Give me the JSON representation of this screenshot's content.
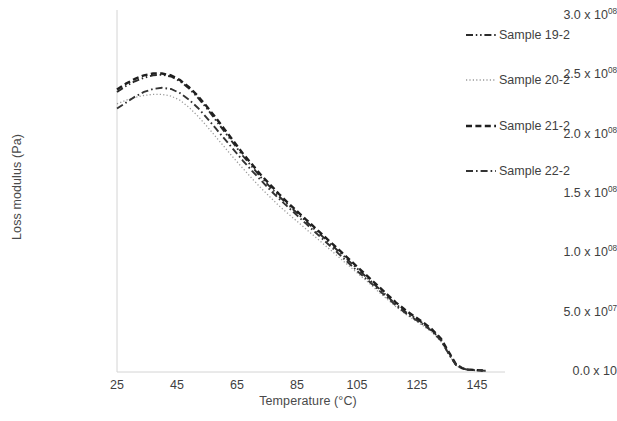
{
  "chart_data": {
    "type": "line",
    "title": "",
    "xlabel": "Temperature (°C)",
    "ylabel": "Loss modulus (Pa)",
    "xlim": [
      25,
      149
    ],
    "ylim": [
      0,
      300000000
    ],
    "xticks": [
      25,
      45,
      65,
      85,
      105,
      125,
      145
    ],
    "xtick_labels": [
      "25",
      "45",
      "65",
      "85",
      "105",
      "125",
      "145"
    ],
    "yticks": [
      0,
      50000000,
      100000000,
      150000000,
      200000000,
      250000000,
      300000000
    ],
    "ytick_labels": [
      {
        "mantissa": "0.0 x 10",
        "exponent": ""
      },
      {
        "mantissa": "5.0 x 10",
        "exponent": "07"
      },
      {
        "mantissa": "1.0 x 10",
        "exponent": "08"
      },
      {
        "mantissa": "1.5 x 10",
        "exponent": "08"
      },
      {
        "mantissa": "2.0 x 10",
        "exponent": "08"
      },
      {
        "mantissa": "2.5 x 10",
        "exponent": "08"
      },
      {
        "mantissa": "3.0 x 10",
        "exponent": "08"
      }
    ],
    "grid": false,
    "legend_position": "right",
    "series": [
      {
        "name": "Sample 19-2",
        "style": "dash-dot-dot",
        "color": "#2b2b2b",
        "width": 1.9,
        "x": [
          25,
          28,
          31,
          34,
          37,
          40,
          43,
          46,
          49,
          52,
          55,
          58,
          61,
          64,
          67,
          70,
          73,
          76,
          79,
          82,
          85,
          88,
          91,
          94,
          97,
          100,
          103,
          106,
          109,
          112,
          115,
          118,
          121,
          124,
          127,
          130,
          133,
          136,
          138,
          140,
          142,
          145,
          148
        ],
        "y": [
          236000000,
          241000000,
          245000000,
          248000000,
          250000000,
          250500000,
          249000000,
          245000000,
          239000000,
          231000000,
          222000000,
          212000000,
          202000000,
          192000000,
          182000000,
          173000000,
          164000000,
          156000000,
          148000000,
          141000000,
          134000000,
          127000000,
          120000000,
          113000000,
          106000000,
          99000000,
          92000000,
          85000000,
          78000000,
          71000000,
          64000000,
          57000000,
          51000000,
          46000000,
          41000000,
          35000000,
          27000000,
          14000000,
          6000000,
          3000000,
          2000000,
          1500000,
          1000000
        ]
      },
      {
        "name": "Sample 20-2",
        "style": "dotted",
        "color": "#9a9a9a",
        "width": 1.3,
        "x": [
          25,
          28,
          31,
          34,
          37,
          40,
          43,
          46,
          49,
          52,
          55,
          58,
          61,
          64,
          67,
          70,
          73,
          76,
          79,
          82,
          85,
          88,
          91,
          94,
          97,
          100,
          103,
          106,
          109,
          112,
          115,
          118,
          121,
          124,
          127,
          130,
          133,
          136,
          138,
          140,
          142,
          145,
          148
        ],
        "y": [
          226000000,
          229000000,
          231500000,
          233000000,
          234000000,
          234000000,
          232500000,
          229000000,
          223000000,
          215500000,
          207000000,
          198000000,
          189000000,
          180000000,
          171500000,
          163000000,
          155000000,
          147500000,
          140000000,
          133500000,
          127000000,
          120500000,
          114000000,
          107500000,
          101000000,
          94500000,
          88000000,
          81500000,
          75000000,
          68000000,
          61500000,
          55000000,
          49000000,
          44000000,
          39000000,
          33500000,
          25500000,
          13000000,
          5500000,
          2800000,
          1800000,
          1300000,
          900000
        ]
      },
      {
        "name": "Sample 21-2",
        "style": "dashed",
        "color": "#1f1f1f",
        "width": 2.4,
        "x": [
          25,
          28,
          31,
          34,
          37,
          40,
          43,
          46,
          49,
          52,
          55,
          58,
          61,
          64,
          67,
          70,
          73,
          76,
          79,
          82,
          85,
          88,
          91,
          94,
          97,
          100,
          103,
          106,
          109,
          112,
          115,
          118,
          121,
          124,
          127,
          130,
          133,
          136,
          138,
          140,
          142,
          145,
          148
        ],
        "y": [
          238000000,
          243000000,
          247000000,
          250000000,
          251500000,
          251500000,
          250000000,
          246000000,
          240000000,
          232500000,
          223500000,
          214000000,
          204000000,
          194000000,
          184000000,
          175000000,
          166000000,
          158000000,
          150000000,
          142500000,
          135500000,
          128500000,
          121500000,
          114500000,
          107500000,
          100500000,
          93500000,
          86500000,
          79500000,
          72500000,
          65500000,
          58500000,
          52500000,
          47000000,
          42000000,
          36000000,
          28000000,
          15000000,
          6500000,
          3300000,
          2200000,
          1600000,
          1100000
        ]
      },
      {
        "name": "Sample 22-2",
        "style": "dash-dot",
        "color": "#333333",
        "width": 1.9,
        "x": [
          25,
          28,
          31,
          34,
          37,
          40,
          43,
          46,
          49,
          52,
          55,
          58,
          61,
          64,
          67,
          70,
          73,
          76,
          79,
          82,
          85,
          88,
          91,
          94,
          97,
          100,
          103,
          106,
          109,
          112,
          115,
          118,
          121,
          124,
          127,
          130,
          133,
          136,
          138,
          140,
          142,
          145,
          148
        ],
        "y": [
          222000000,
          227000000,
          232000000,
          236000000,
          238500000,
          239500000,
          238500000,
          235000000,
          229500000,
          222500000,
          214000000,
          205000000,
          196000000,
          187000000,
          178000000,
          169500000,
          161500000,
          153500000,
          146000000,
          139000000,
          132000000,
          125000000,
          118000000,
          111000000,
          104000000,
          97000000,
          90000000,
          83000000,
          76500000,
          69500000,
          63000000,
          56000000,
          50000000,
          45000000,
          40000000,
          34500000,
          26500000,
          13500000,
          5800000,
          3000000,
          1900000,
          1400000,
          950000
        ]
      }
    ]
  },
  "legend": {
    "items": [
      {
        "label": "Sample 19-2",
        "style": "dash-dot-dot"
      },
      {
        "label": "Sample 20-2",
        "style": "dotted"
      },
      {
        "label": "Sample 21-2",
        "style": "dashed"
      },
      {
        "label": "Sample 22-2",
        "style": "dash-dot"
      }
    ]
  },
  "axes": {
    "axis_color": "#d4d4d4",
    "text_color": "#3f3f3f"
  }
}
